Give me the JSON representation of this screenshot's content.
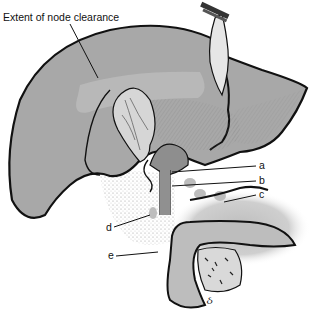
{
  "figure": {
    "title_annotation": "Extent of node clearance",
    "labels": [
      {
        "id": "a",
        "text": "a"
      },
      {
        "id": "b",
        "text": "b"
      },
      {
        "id": "c",
        "text": "c"
      },
      {
        "id": "d",
        "text": "d"
      },
      {
        "id": "e",
        "text": "e"
      }
    ],
    "signature": "ઠ",
    "colors": {
      "liver_fill": "#a8a8a8",
      "liver_outline": "#111111",
      "light_tissue": "#d6d6d6",
      "node_fill": "#bdbdbd",
      "pancreas_shadow": "#c8c8c8",
      "background": "#ffffff"
    }
  }
}
